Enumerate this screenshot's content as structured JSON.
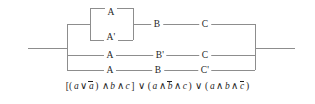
{
  "figure": {
    "name": "switching-circuit-diagram",
    "line_color": "#8d8d8d",
    "text_color": "#1f1f1f",
    "background": "#ffffff"
  },
  "circuit": {
    "terminals": {
      "left_lead_label": "",
      "right_lead_label": ""
    },
    "branches": [
      {
        "id": "branch-1",
        "parallel_block": {
          "top_label": "A",
          "bottom_label": "A'"
        },
        "series_labels": [
          "B",
          "C"
        ]
      },
      {
        "id": "branch-2",
        "series_labels": [
          "A",
          "B'",
          "C"
        ]
      },
      {
        "id": "branch-3",
        "series_labels": [
          "A",
          "B",
          "C'"
        ]
      }
    ],
    "nodes": [
      {
        "id": "n-a-top",
        "label": "A",
        "x": 111,
        "y": 12
      },
      {
        "id": "n-a-prime",
        "label": "A'",
        "x": 111,
        "y": 37
      },
      {
        "id": "n-b-row1",
        "label": "B",
        "x": 157,
        "y": 24
      },
      {
        "id": "n-c-row1",
        "label": "C",
        "x": 205,
        "y": 24
      },
      {
        "id": "n-a-row2",
        "label": "A",
        "x": 110,
        "y": 55
      },
      {
        "id": "n-bp-row2",
        "label": "B'",
        "x": 160,
        "y": 55
      },
      {
        "id": "n-c-row2",
        "label": "C",
        "x": 205,
        "y": 55
      },
      {
        "id": "n-a-row3",
        "label": "A",
        "x": 110,
        "y": 70
      },
      {
        "id": "n-b-row3",
        "label": "B",
        "x": 158,
        "y": 70
      },
      {
        "id": "n-cp-row3",
        "label": "C'",
        "x": 205,
        "y": 70
      }
    ]
  },
  "formula": {
    "full_text": "[(a ∨ ā) ∧ b ∧ c] ∨ (a ∧ b̄ ∧ c) ∨ (a ∧ b ∧ c̄)",
    "open_bracket": "[(",
    "var_a": "a",
    "or": "∨",
    "not_a": "a",
    "close_paren": ")",
    "and": "∧",
    "var_b": "b",
    "var_c": "c",
    "close_bracket": "]",
    "not_b": "b",
    "not_c": "c",
    "open_paren": "("
  }
}
